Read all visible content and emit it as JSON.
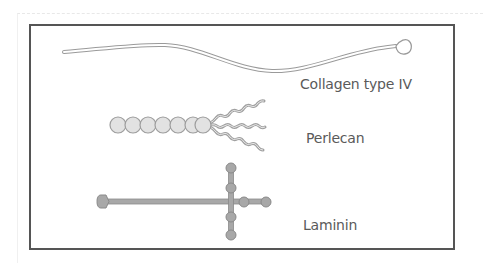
{
  "figure": {
    "colors": {
      "frame": "#555555",
      "label_text": "#5a5a5a",
      "collagen_stroke": "#9a9a9a",
      "collagen_fill": "#ffffff",
      "perlecan_bead_fill": "#e2e2e2",
      "perlecan_bead_stroke": "#9c9c9c",
      "perlecan_tail": "#a0a0a0",
      "laminin_fill": "#a8a8a8",
      "laminin_stroke": "#8a8a8a"
    },
    "molecules": [
      {
        "id": "collagen",
        "label": "Collagen type IV",
        "shape": "long thin thread with terminal globular loop"
      },
      {
        "id": "perlecan",
        "label": "Perlecan",
        "shape": "chain of 7 globular beads with 3 wavy side chains",
        "bead_count": 7,
        "tail_count": 3
      },
      {
        "id": "laminin",
        "label": "Laminin",
        "shape": "cross-shaped with globular knobs at arm ends"
      }
    ]
  }
}
